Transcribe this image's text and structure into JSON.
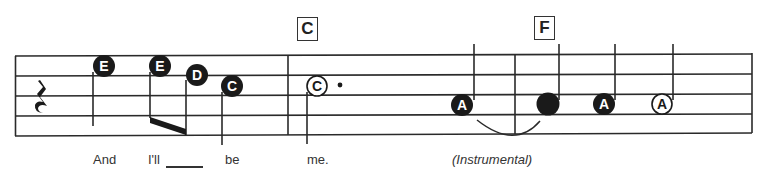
{
  "score": {
    "chords": [
      {
        "label": "C",
        "x": 297
      },
      {
        "label": "F",
        "x": 534
      }
    ],
    "lyrics": [
      {
        "text": "And",
        "x": 93,
        "italic": false
      },
      {
        "text": "I'll",
        "x": 148,
        "italic": false
      },
      {
        "text": "be",
        "x": 225,
        "italic": false
      },
      {
        "text": "me.",
        "x": 307,
        "italic": false
      },
      {
        "text": "(Instrumental)",
        "x": 452,
        "italic": true
      }
    ],
    "notes": [
      {
        "letter": "E",
        "x": 104,
        "y": 66,
        "filled": true,
        "stem": "down"
      },
      {
        "letter": "E",
        "x": 160,
        "y": 66,
        "filled": true,
        "stem": "down-beam"
      },
      {
        "letter": "D",
        "x": 197,
        "y": 75,
        "filled": true,
        "stem": "down-beam"
      },
      {
        "letter": "C",
        "x": 232,
        "y": 86,
        "filled": true,
        "stem": "down"
      },
      {
        "letter": "C",
        "x": 317,
        "y": 86,
        "filled": false,
        "stem": "down",
        "dotted": true
      },
      {
        "letter": "A",
        "x": 462,
        "y": 105,
        "filled": true,
        "stem": "up"
      },
      {
        "letter": "",
        "x": 548,
        "y": 105,
        "filled": true,
        "stem": "up"
      },
      {
        "letter": "A",
        "x": 604,
        "y": 105,
        "filled": true,
        "stem": "up"
      },
      {
        "letter": "A",
        "x": 662,
        "y": 105,
        "filled": false,
        "stem": "up"
      }
    ],
    "rest": "quarter-rest",
    "tie": "A-to-A tie across barline"
  }
}
